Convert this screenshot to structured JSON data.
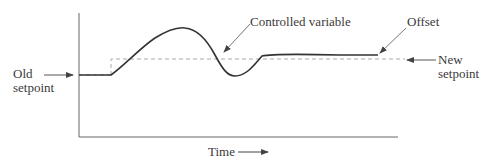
{
  "diagram": {
    "type": "process-control-response",
    "labels": {
      "old_setpoint": [
        "Old",
        "setpoint"
      ],
      "new_setpoint": [
        "New",
        "setpoint"
      ],
      "controlled_variable": "Controlled variable",
      "offset": "Offset",
      "time_axis": "Time"
    },
    "colors": {
      "axis": "#555555",
      "curve": "#333333",
      "setpoint_dashed": "#aaaaaa",
      "arrow": "#555555",
      "text": "#3a3a3a"
    }
  }
}
